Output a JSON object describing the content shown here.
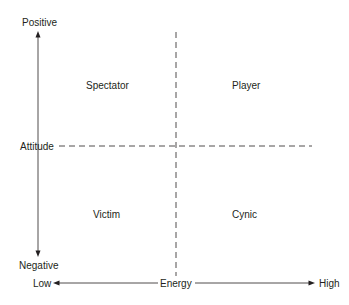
{
  "diagram": {
    "type": "quadrant",
    "colors": {
      "line": "#231f20",
      "text": "#231f20",
      "background": "#ffffff"
    },
    "y_axis": {
      "name": "Attitude",
      "top_label": "Positive",
      "bottom_label": "Negative",
      "arrow_top_icon": "arrow-up",
      "arrow_bottom_icon": "arrow-down"
    },
    "x_axis": {
      "name": "Energy",
      "left_label": "Low",
      "right_label": "High",
      "arrow_left_icon": "arrow-left",
      "arrow_right_icon": "arrow-right"
    },
    "quadrants": {
      "top_left": "Spectator",
      "top_right": "Player",
      "bottom_left": "Victim",
      "bottom_right": "Cynic"
    }
  }
}
